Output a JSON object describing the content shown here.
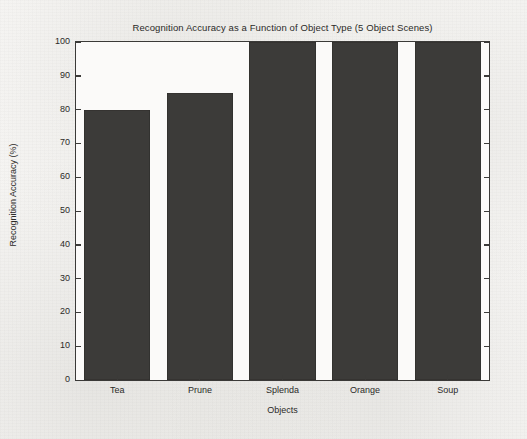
{
  "chart_data": {
    "type": "bar",
    "title": "Recognition Accuracy as a Function of Object Type (5 Object Scenes)",
    "categories": [
      "Tea",
      "Prune",
      "Splenda",
      "Orange",
      "Soup"
    ],
    "values": [
      80,
      85,
      100,
      100,
      100
    ],
    "xlabel": "Objects",
    "ylabel": "Recognition Accuracy (%)",
    "ylim": [
      0,
      100
    ],
    "yticks": [
      0,
      10,
      20,
      30,
      40,
      50,
      60,
      70,
      80,
      90,
      100
    ],
    "ytick_labels": [
      "0",
      "10",
      "20",
      "30",
      "40",
      "50",
      "60",
      "70",
      "80",
      "90",
      "100"
    ],
    "grid": false,
    "legend": null,
    "bar_color": "#3c3b39",
    "axis_color": "#3b3a38",
    "plot_background": "#fbfaf9",
    "page_background": "#f4f3f1"
  }
}
